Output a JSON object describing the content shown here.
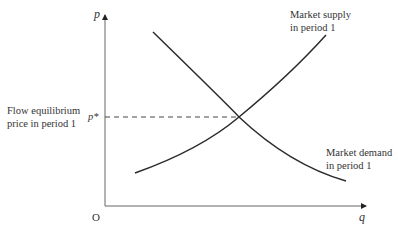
{
  "diagram": {
    "axes": {
      "y_label": "p",
      "x_label": "q",
      "origin_label": "O"
    },
    "equilibrium": {
      "price_symbol": "p*",
      "description_line1": "Flow equilibrium",
      "description_line2": "price in period 1"
    },
    "curves": [
      {
        "name": "supply",
        "label_line1": "Market supply",
        "label_line2": "in period 1",
        "slope": "upward"
      },
      {
        "name": "demand",
        "label_line1": "Market demand",
        "label_line2": "in period 1",
        "slope": "downward"
      }
    ],
    "colors": {
      "line": "#2b2b2b",
      "axis": "#555555",
      "text": "#333333"
    }
  }
}
